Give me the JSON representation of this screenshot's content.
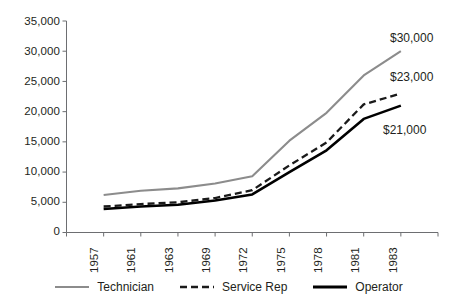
{
  "chart_data": {
    "type": "line",
    "title": "",
    "subtitle": "",
    "xlabel": "",
    "ylabel": "",
    "grid": false,
    "legend_position": "bottom",
    "ylim": [
      0,
      35000
    ],
    "yticks": [
      "0",
      "5,000",
      "10,000",
      "15,000",
      "20,000",
      "25,000",
      "30,000",
      "35,000"
    ],
    "ytick_values": [
      0,
      5000,
      10000,
      15000,
      20000,
      25000,
      30000,
      35000
    ],
    "categories": [
      "1957",
      "1961",
      "1963",
      "1969",
      "1972",
      "1975",
      "1978",
      "1981",
      "1983"
    ],
    "series": [
      {
        "name": "Technician",
        "color": "#8c8c8c",
        "style": "solid",
        "width": 2.1,
        "values": [
          6200,
          6900,
          7300,
          8100,
          9300,
          15200,
          19800,
          26000,
          30000
        ],
        "end_label": "$30,000"
      },
      {
        "name": "Service Rep",
        "color": "#1a1a1a",
        "style": "dashed",
        "width": 2.3,
        "values": [
          4300,
          4700,
          5000,
          5700,
          7000,
          11100,
          14900,
          21200,
          23000
        ],
        "end_label": "$23,000"
      },
      {
        "name": "Operator",
        "color": "#000000",
        "style": "solid",
        "width": 2.6,
        "values": [
          3900,
          4300,
          4600,
          5300,
          6300,
          10000,
          13600,
          18800,
          21000
        ],
        "end_label": "$21,000"
      }
    ],
    "annotations": [
      {
        "text": "$30,000",
        "series": "Technician"
      },
      {
        "text": "$23,000",
        "series": "Service Rep"
      },
      {
        "text": "$21,000",
        "series": "Operator"
      }
    ],
    "axis_color": "#6d6e71"
  },
  "legend": {
    "items": [
      {
        "label": "Technician",
        "color": "#8c8c8c",
        "style": "solid"
      },
      {
        "label": "Service Rep",
        "color": "#1a1a1a",
        "style": "dashed"
      },
      {
        "label": "Operator",
        "color": "#000000",
        "style": "solid"
      }
    ]
  }
}
